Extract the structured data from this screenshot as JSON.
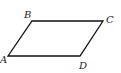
{
  "diagram": {
    "type": "parallelogram",
    "stroke_color": "#111111",
    "vertices": [
      {
        "label": "A",
        "x": 8,
        "y": 56,
        "label_x": 0,
        "label_y": 63
      },
      {
        "label": "B",
        "x": 32,
        "y": 21,
        "label_x": 24,
        "label_y": 18
      },
      {
        "label": "C",
        "x": 103,
        "y": 21,
        "label_x": 106,
        "label_y": 23
      },
      {
        "label": "D",
        "x": 80,
        "y": 56,
        "label_x": 79,
        "label_y": 69
      }
    ],
    "labels": {
      "a": "A",
      "b": "B",
      "c": "C",
      "d": "D"
    }
  }
}
